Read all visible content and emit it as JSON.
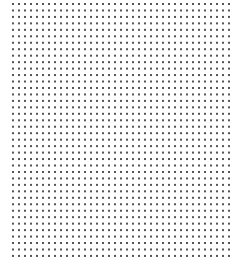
{
  "canvas": {
    "width": 242,
    "height": 276,
    "background": "#ffffff"
  },
  "dot_grid": {
    "origin_x": 13,
    "origin_y": 4,
    "spacing_x": 6,
    "spacing_y": 6.46,
    "columns": 37,
    "rows": 40,
    "dot_size": 2,
    "dot_color": "#555555"
  }
}
